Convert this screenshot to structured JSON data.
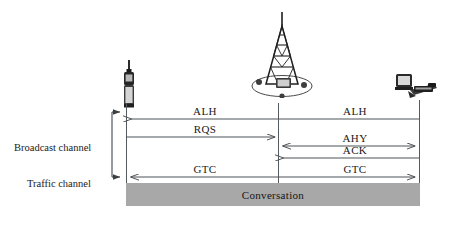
{
  "diagram": {
    "nodes": [
      {
        "id": "mobile",
        "name": "mobile-station-icon",
        "x": 118,
        "y": 62
      },
      {
        "id": "bts",
        "name": "base-station-tower-icon",
        "x": 250,
        "y": 12
      },
      {
        "id": "msc",
        "name": "switching-center-computer-icon",
        "x": 396,
        "y": 74
      }
    ],
    "messages": [
      {
        "id": "m1",
        "label": "ALH",
        "side": "left",
        "direction": "left",
        "row": 1
      },
      {
        "id": "m2",
        "label": "ALH",
        "side": "right",
        "direction": "left",
        "row": 1
      },
      {
        "id": "m3",
        "label": "RQS",
        "side": "left",
        "direction": "right",
        "row": 2
      },
      {
        "id": "m4",
        "label": "AHY",
        "side": "right",
        "direction": "both",
        "row": 3
      },
      {
        "id": "m5",
        "label": "ACK",
        "side": "right",
        "direction": "left",
        "row": 4
      },
      {
        "id": "m6",
        "label": "GTC",
        "side": "left",
        "direction": "left",
        "row": 5
      },
      {
        "id": "m7",
        "label": "GTC",
        "side": "right",
        "direction": "right",
        "row": 5
      }
    ],
    "channels": [
      {
        "id": "broadcast",
        "label": "Broadcast channel"
      },
      {
        "id": "traffic",
        "label": "Traffic channel"
      }
    ],
    "conversation": {
      "label": "Conversation"
    },
    "colors": {
      "line": "#555a5e",
      "text": "#1a1a1a",
      "conversation_fill": "#a8a8a8",
      "background": "#ffffff"
    }
  }
}
